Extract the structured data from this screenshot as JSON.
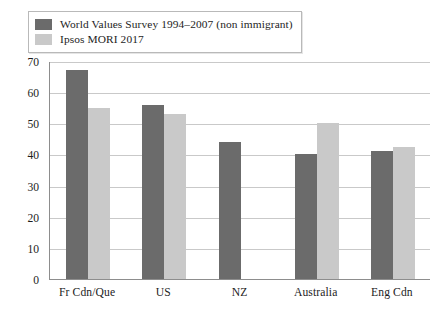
{
  "chart_data": {
    "type": "bar",
    "title": "",
    "subtitle": "",
    "xlabel": "",
    "ylabel": "",
    "ylim": [
      0,
      70
    ],
    "ytick_step": 10,
    "yticks": [
      "0",
      "10",
      "20",
      "30",
      "40",
      "50",
      "60",
      "70"
    ],
    "grid": true,
    "legend_position": "top-left",
    "categories": [
      "Fr Cdn/Que",
      "US",
      "NZ",
      "Australia",
      "Eng Cdn"
    ],
    "series": [
      {
        "name": "World Values Survey 1994–2007 (non immigrant)",
        "color": "#6b6b6b",
        "values": [
          67,
          56,
          44,
          40,
          41
        ]
      },
      {
        "name": "Ipsos MORI 2017",
        "color": "#c9c9c9",
        "values": [
          55,
          53,
          null,
          50,
          42.5
        ]
      }
    ]
  },
  "legend": {
    "items": [
      {
        "label": "World Values Survey 1994–2007 (non immigrant)",
        "color": "#6b6b6b"
      },
      {
        "label": "Ipsos MORI 2017",
        "color": "#c9c9c9"
      }
    ]
  },
  "colors": {
    "series_dark": "#6b6b6b",
    "series_light": "#c9c9c9",
    "axis": "#8d8d8d",
    "grid": "#c9c9c9",
    "text": "#1d1d1d",
    "background": "#ffffff"
  }
}
